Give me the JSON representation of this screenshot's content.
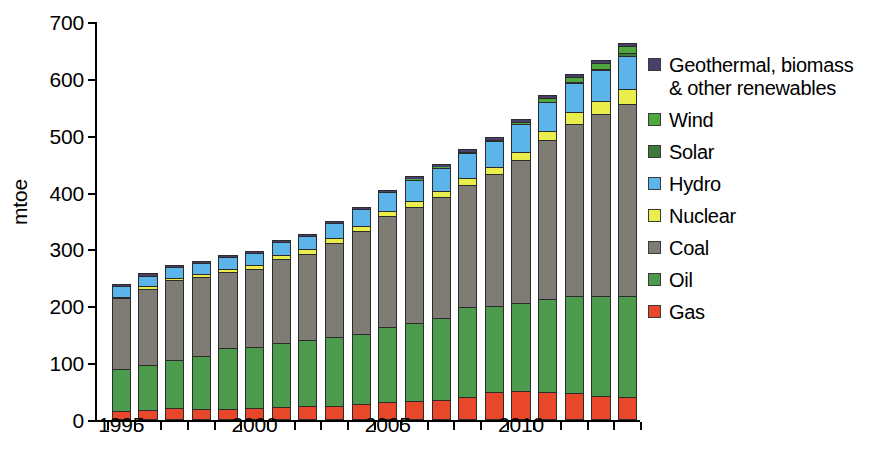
{
  "chart_data": {
    "type": "bar",
    "stacked": true,
    "title": "",
    "xlabel": "",
    "ylabel": "mtoe",
    "ylim": [
      0,
      700
    ],
    "yticks": [
      0,
      100,
      200,
      300,
      400,
      500,
      600,
      700
    ],
    "ytick_labels": [
      "0",
      "100",
      "200",
      "300",
      "400",
      "500",
      "600",
      "700"
    ],
    "grid": false,
    "legend_position": "right",
    "categories": [
      "1995",
      "1996",
      "1997",
      "1998",
      "1999",
      "1900",
      "2001",
      "2002",
      "2003",
      "2004",
      "2005",
      "2006",
      "2007",
      "2008",
      "2009",
      "2010",
      "2011",
      "2012",
      "2013",
      "2014"
    ],
    "x": [
      1995,
      1996,
      1997,
      1998,
      1999,
      2000,
      2001,
      2002,
      2003,
      2004,
      2005,
      2006,
      2007,
      2008,
      2009,
      2010,
      2011,
      2012,
      2013,
      2014
    ],
    "xtick_labels": [
      "1995",
      "2000",
      "2005",
      "2010"
    ],
    "xtick_values": [
      1995,
      2000,
      2005,
      2010
    ],
    "series": [
      {
        "name": "Gas",
        "color": "#E8472A",
        "values": [
          16,
          18,
          21,
          20,
          20,
          21,
          23,
          24,
          25,
          28,
          31,
          33,
          36,
          41,
          50,
          51,
          50,
          48,
          42,
          40
        ]
      },
      {
        "name": "Oil",
        "color": "#4C9A4C",
        "values": [
          74,
          79,
          85,
          93,
          106,
          108,
          112,
          116,
          121,
          124,
          132,
          137,
          144,
          157,
          151,
          155,
          162,
          170,
          176,
          178
        ]
      },
      {
        "name": "Coal",
        "color": "#7E7C74",
        "values": [
          124,
          134,
          140,
          138,
          134,
          137,
          148,
          152,
          166,
          180,
          195,
          205,
          212,
          216,
          232,
          252,
          280,
          302,
          320,
          338
        ]
      },
      {
        "name": "Nuclear",
        "color": "#E9EE4B",
        "values": [
          3,
          4,
          4,
          5,
          6,
          7,
          7,
          8,
          9,
          9,
          10,
          11,
          11,
          11,
          12,
          14,
          17,
          21,
          23,
          26
        ]
      },
      {
        "name": "Hydro",
        "color": "#5BB4EA",
        "values": [
          18,
          19,
          19,
          20,
          20,
          21,
          23,
          24,
          25,
          30,
          33,
          37,
          41,
          44,
          45,
          48,
          50,
          52,
          54,
          58
        ]
      },
      {
        "name": "Solar",
        "color": "#3E7A3A",
        "values": [
          0,
          0,
          0,
          0,
          0,
          0,
          0,
          0,
          0,
          0,
          0,
          0,
          0,
          0,
          0,
          0,
          1,
          2,
          3,
          5
        ]
      },
      {
        "name": "Wind",
        "color": "#4FA83E",
        "values": [
          0,
          0,
          0,
          0,
          0,
          0,
          0,
          0,
          0,
          0,
          0,
          1,
          1,
          2,
          3,
          4,
          6,
          8,
          10,
          12
        ]
      },
      {
        "name": "Geothermal, biomass & other renewables",
        "color": "#4A3F6B",
        "values": [
          4,
          4,
          4,
          4,
          4,
          4,
          4,
          4,
          4,
          4,
          4,
          5,
          5,
          5,
          5,
          5,
          5,
          6,
          6,
          6
        ]
      }
    ],
    "totals": [
      239,
      258,
      273,
      280,
      290,
      298,
      317,
      328,
      350,
      375,
      405,
      429,
      450,
      476,
      498,
      529,
      571,
      609,
      634,
      663
    ]
  },
  "legend": {
    "items": [
      {
        "label": "Geothermal, biomass\n& other renewables",
        "color": "#4A3F6B",
        "name": "geothermal-biomass-other"
      },
      {
        "label": "Wind",
        "color": "#4FA83E",
        "name": "wind"
      },
      {
        "label": "Solar",
        "color": "#3E7A3A",
        "name": "solar"
      },
      {
        "label": "Hydro",
        "color": "#5BB4EA",
        "name": "hydro"
      },
      {
        "label": "Nuclear",
        "color": "#E9EE4B",
        "name": "nuclear"
      },
      {
        "label": "Coal",
        "color": "#7E7C74",
        "name": "coal"
      },
      {
        "label": "Oil",
        "color": "#4C9A4C",
        "name": "oil"
      },
      {
        "label": "Gas",
        "color": "#E8472A",
        "name": "gas"
      }
    ]
  }
}
